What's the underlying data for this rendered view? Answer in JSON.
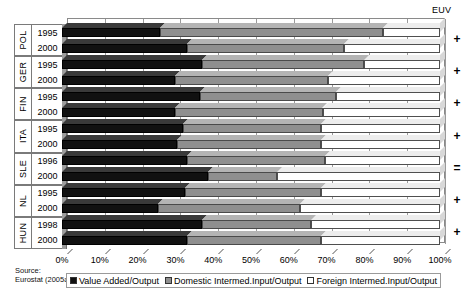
{
  "euv_header": "EUV",
  "source": {
    "line1": "Source:",
    "line2": "Eurostat (2005a)"
  },
  "legend": {
    "items": [
      {
        "label": "Value Added/Output",
        "key": "va",
        "color": "#111111"
      },
      {
        "label": "Domestic Intermed.Input/Output",
        "key": "dom",
        "color": "#8f8f8f"
      },
      {
        "label": "Foreign Intermed.Input/Output",
        "key": "for",
        "color": "#ffffff"
      }
    ]
  },
  "chart_data": {
    "type": "bar",
    "orientation": "horizontal",
    "stacked": true,
    "title": "",
    "xlabel": "",
    "ylabel": "",
    "xlim": [
      0,
      100
    ],
    "xticks": [
      "0%",
      "10%",
      "20%",
      "30%",
      "40%",
      "50%",
      "60%",
      "70%",
      "80%",
      "90%",
      "100%"
    ],
    "grid": true,
    "legend_position": "bottom",
    "series": [
      {
        "name": "Value Added/Output",
        "color": "#111111"
      },
      {
        "name": "Domestic Intermed.Input/Output",
        "color": "#8f8f8f"
      },
      {
        "name": "Foreign Intermed.Input/Output",
        "color": "#ffffff"
      }
    ],
    "groups": [
      {
        "country": "POL",
        "euv": "+",
        "rows": [
          {
            "year": "1995",
            "values": [
              26.0,
              59.0,
              15.0
            ]
          },
          {
            "year": "2000",
            "values": [
              33.0,
              41.5,
              25.5
            ]
          }
        ]
      },
      {
        "country": "GER",
        "euv": "+",
        "rows": [
          {
            "year": "1995",
            "values": [
              37.0,
              43.0,
              20.0
            ]
          },
          {
            "year": "2000",
            "values": [
              30.0,
              40.5,
              29.5
            ]
          }
        ]
      },
      {
        "country": "FIN",
        "euv": "+",
        "rows": [
          {
            "year": "1995",
            "values": [
              36.5,
              36.0,
              27.5
            ]
          },
          {
            "year": "2000",
            "values": [
              30.0,
              39.0,
              31.0
            ]
          }
        ]
      },
      {
        "country": "ITA",
        "euv": "+",
        "rows": [
          {
            "year": "1995",
            "values": [
              32.0,
              36.5,
              31.5
            ]
          },
          {
            "year": "2000",
            "values": [
              30.5,
              38.0,
              31.5
            ]
          }
        ]
      },
      {
        "country": "SLE",
        "euv": "=",
        "rows": [
          {
            "year": "1996",
            "values": [
              33.0,
              36.5,
              30.5
            ]
          },
          {
            "year": "2000",
            "values": [
              38.5,
              18.5,
              43.0
            ]
          }
        ]
      },
      {
        "country": "NL",
        "euv": "+",
        "rows": [
          {
            "year": "1995",
            "values": [
              32.5,
              36.0,
              31.5
            ]
          },
          {
            "year": "2000",
            "values": [
              25.5,
              37.5,
              37.0
            ]
          }
        ]
      },
      {
        "country": "HUN",
        "euv": "+",
        "rows": [
          {
            "year": "1998",
            "values": [
              37.0,
              29.0,
              34.0
            ]
          },
          {
            "year": "2000",
            "values": [
              33.0,
              35.5,
              31.5
            ]
          }
        ]
      }
    ]
  }
}
